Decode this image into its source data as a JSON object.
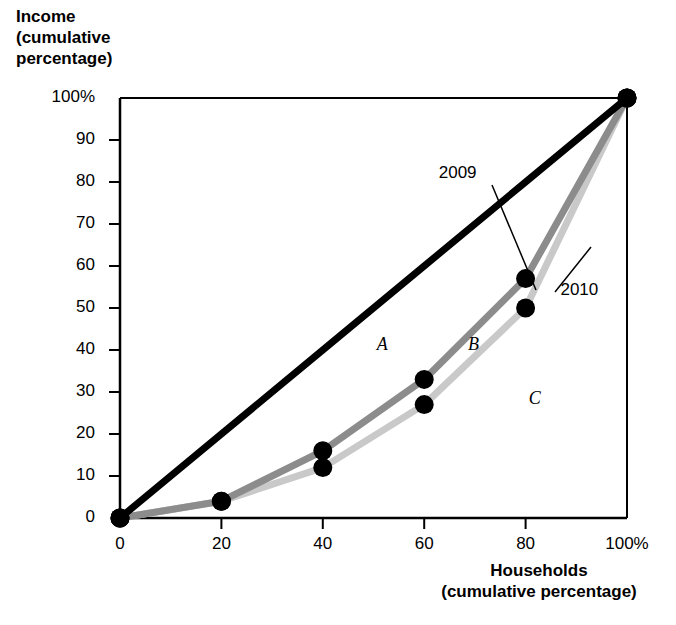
{
  "chart_data": {
    "type": "line",
    "title": "",
    "xlabel": "Households (cumulative percentage)",
    "ylabel": "Income (cumulative percentage)",
    "xlim": [
      0,
      100
    ],
    "ylim": [
      0,
      100
    ],
    "grid": false,
    "legend_position": "inline-annotation",
    "x_ticks": [
      "0",
      "20",
      "40",
      "60",
      "80",
      "100%"
    ],
    "x_tick_values": [
      0,
      20,
      40,
      60,
      80,
      100
    ],
    "y_ticks": [
      "0",
      "10",
      "20",
      "30",
      "40",
      "50",
      "60",
      "70",
      "80",
      "90",
      "100%"
    ],
    "y_tick_values": [
      0,
      10,
      20,
      30,
      40,
      50,
      60,
      70,
      80,
      90,
      100
    ],
    "x": [
      0,
      20,
      40,
      60,
      80,
      100
    ],
    "series": [
      {
        "name": "line-of-equality",
        "label": "",
        "color": "#000000",
        "width": 7,
        "values": [
          0,
          20,
          40,
          60,
          80,
          100
        ],
        "markers": [
          0,
          100
        ]
      },
      {
        "name": "2009",
        "label": "2009",
        "color": "#8c8c8c",
        "width": 7,
        "values": [
          0,
          4,
          16,
          33,
          57,
          100
        ],
        "markers": [
          0,
          4,
          16,
          33,
          57,
          100
        ]
      },
      {
        "name": "2010",
        "label": "2010",
        "color": "#c9c9c9",
        "width": 7,
        "values": [
          0,
          4,
          12,
          27,
          50,
          100
        ],
        "markers": [
          0,
          4,
          12,
          27,
          50,
          100
        ]
      }
    ],
    "annotations": [
      {
        "name": "area-a",
        "text": "A",
        "x": 52,
        "y": 41,
        "style": "italic"
      },
      {
        "name": "area-b",
        "text": "B",
        "x": 70,
        "y": 41,
        "style": "italic"
      },
      {
        "name": "area-c",
        "text": "C",
        "x": 82,
        "y": 28,
        "style": "italic"
      },
      {
        "name": "label-2009",
        "text": "2009",
        "x": 68,
        "y": 82,
        "style": "leader"
      },
      {
        "name": "label-2010",
        "text": "2010",
        "x": 92,
        "y": 54,
        "style": "leader"
      }
    ]
  },
  "axes": {
    "y_title": "Income\n(cumulative\npercentage)",
    "x_title": "Households\n(cumulative percentage)"
  },
  "colors": {
    "equality_line": "#000000",
    "series_2009": "#8c8c8c",
    "series_2010": "#c9c9c9",
    "axis": "#000000",
    "background": "#ffffff",
    "marker": "#000000"
  }
}
